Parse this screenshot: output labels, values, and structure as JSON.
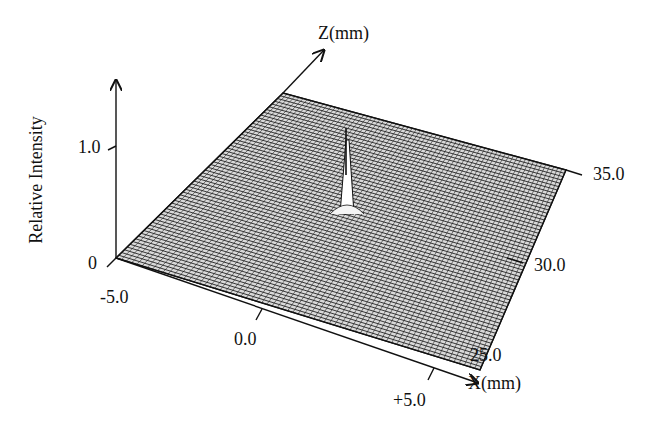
{
  "chart_data": {
    "type": "surface3d",
    "title": "",
    "axes": {
      "vertical": {
        "label": "Relative Intensity",
        "ticks": [
          "0",
          "1.0"
        ],
        "range": [
          0,
          1.0
        ]
      },
      "x": {
        "label": "X(mm)",
        "ticks": [
          "-5.0",
          "0.0",
          "+5.0"
        ],
        "range": [
          -5.0,
          5.0
        ]
      },
      "z": {
        "label": "Z(mm)",
        "ticks": [
          "25.0",
          "30.0",
          "35.0"
        ],
        "range": [
          25.0,
          35.0
        ]
      }
    },
    "grid": "wireframe mesh",
    "features": [
      {
        "name": "focal peak",
        "x": 0.0,
        "z": 30.5,
        "relative_intensity": 1.0,
        "description": "single sharp narrow spike rising from flat near-zero background"
      }
    ],
    "background_level": 0.0
  },
  "labels": {
    "ylabel": "Relative Intensity",
    "y_tick_0": "0",
    "y_tick_1": "1.0",
    "z_axis": "Z(mm)",
    "x_axis": "X(mm)",
    "x_tick_neg": "-5.0",
    "x_tick_mid": "0.0",
    "x_tick_pos": "+5.0",
    "z_tick_25": "25.0",
    "z_tick_30": "30.0",
    "z_tick_35": "35.0"
  },
  "colors": {
    "ink": "#111111",
    "background": "#ffffff",
    "mesh_fill": "#ffffff"
  }
}
